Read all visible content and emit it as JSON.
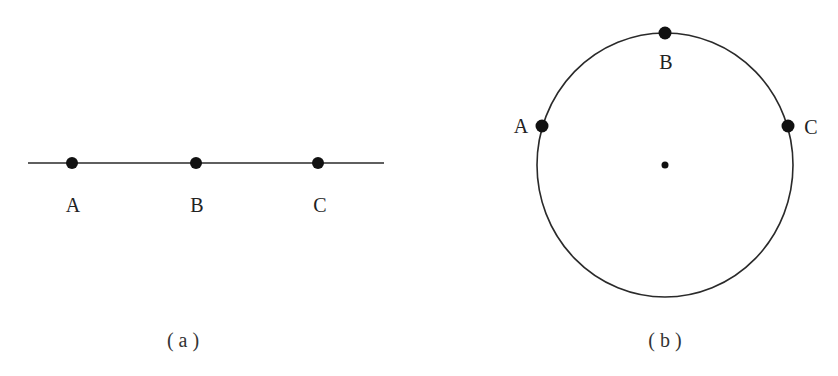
{
  "figure_a": {
    "caption": "( a )",
    "shape": "line",
    "points": [
      {
        "label": "A"
      },
      {
        "label": "B"
      },
      {
        "label": "C"
      }
    ]
  },
  "figure_b": {
    "caption": "( b )",
    "shape": "circle",
    "has_center_point": true,
    "points": [
      {
        "label": "A"
      },
      {
        "label": "B"
      },
      {
        "label": "C"
      }
    ]
  },
  "colors": {
    "stroke": "#2a2a2a",
    "point": "#111111",
    "background": "#ffffff"
  }
}
